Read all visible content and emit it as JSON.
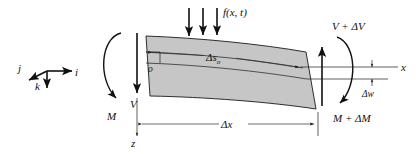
{
  "figure": {
    "type": "free-body-diagram",
    "background_color": "#ffffff",
    "beam_fill_color": "#c6c6c6",
    "line_color": "#1a1a1a"
  },
  "triad": {
    "name": "unit-vector-triad",
    "vectors": [
      {
        "key": "i",
        "label": "i",
        "direction": "right"
      },
      {
        "key": "j",
        "label": "j",
        "direction": "down-left"
      },
      {
        "key": "k",
        "label": "k",
        "direction": "down"
      }
    ]
  },
  "left_face": {
    "shear_label": "V",
    "moment_label": "M",
    "shear_direction": "down",
    "moment_direction": "counterclockwise"
  },
  "right_face": {
    "shear_label": "V + ΔV",
    "moment_label": "M + ΔM",
    "shear_direction": "up",
    "moment_direction": "clockwise"
  },
  "load": {
    "label_main": "f",
    "label_args": "(x, t)",
    "label_full": "f(x, t)",
    "arrow_count": 3,
    "direction": "down"
  },
  "axes": {
    "x_label": "x",
    "z_label": "z",
    "origin_label": "o"
  },
  "dimensions": {
    "arc_length": {
      "label_main": "Δs",
      "label_sub": "o",
      "label_full": "Δsₒ"
    },
    "horizontal": {
      "label": "Δx"
    },
    "deflection": {
      "label": "Δw"
    }
  }
}
